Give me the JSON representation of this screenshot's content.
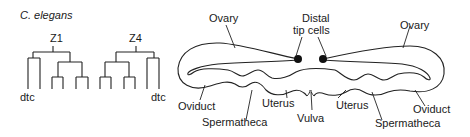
{
  "figure": {
    "species_label": "C. elegans",
    "lineage": {
      "z1_label": "Z1",
      "z4_label": "Z4",
      "z1_dtc_label": "dtc",
      "z4_dtc_label": "dtc"
    },
    "gonad": {
      "labels": {
        "ovary_left": "Ovary",
        "ovary_right": "Ovary",
        "distal_tip_line1": "Distal",
        "distal_tip_line2": "tip cells",
        "oviduct_left": "Oviduct",
        "oviduct_right": "Oviduct",
        "uterus_left": "Uterus",
        "uterus_right": "Uterus",
        "spermatheca_left": "Spermatheca",
        "spermatheca_right": "Spermatheca",
        "vulva": "Vulva"
      }
    },
    "colors": {
      "line": "#222222",
      "text": "#1a1a1a",
      "background": "#ffffff"
    }
  }
}
